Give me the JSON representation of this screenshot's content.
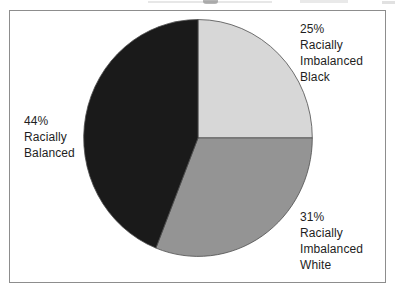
{
  "chart_data": {
    "type": "pie",
    "title": "",
    "slices": [
      {
        "label": "Racially Imbalanced Black",
        "value": 25,
        "percent_label": "25%",
        "color": "#d7d7d7",
        "callout": "25%\nRacially\nImbalanced\nBlack"
      },
      {
        "label": "Racially Imbalanced White",
        "value": 31,
        "percent_label": "31%",
        "color": "#949494",
        "callout": "31%\nRacially\nImbalanced\nWhite"
      },
      {
        "label": "Racially Balanced",
        "value": 44,
        "percent_label": "44%",
        "color": "#1a1a1a",
        "callout": "44%\nRacially\nBalanced"
      }
    ],
    "start_angle_deg": 0,
    "direction": "clockwise",
    "legend_position": "callout-labels-outside",
    "outline_color": "#4d4d4d",
    "frame_border_color": "#8d8d8d",
    "background": "#ffffff"
  }
}
